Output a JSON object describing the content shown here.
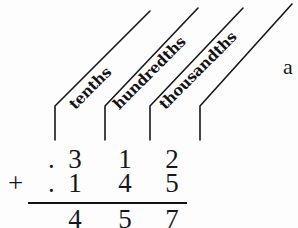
{
  "figure": {
    "kind": "decimal-addition-place-value-diagram",
    "background_color": "#fdfdfd",
    "ink_color": "#17171a",
    "place_labels": [
      {
        "text": "tenths",
        "x": 78,
        "y": 95,
        "angle": -45
      },
      {
        "text": "hundredths",
        "x": 122,
        "y": 95,
        "angle": -45
      },
      {
        "text": "thousandths",
        "x": 168,
        "y": 95,
        "angle": -45
      }
    ],
    "leader_lines": [
      {
        "vertical_x": 55,
        "vertical_top": 106,
        "vertical_bottom": 140,
        "diagonal_end_x": 150,
        "diagonal_end_y": 11
      },
      {
        "vertical_x": 105,
        "vertical_top": 106,
        "vertical_bottom": 140,
        "diagonal_end_x": 198,
        "diagonal_end_y": 8
      },
      {
        "vertical_x": 150,
        "vertical_top": 106,
        "vertical_bottom": 140,
        "diagonal_end_x": 243,
        "diagonal_end_y": 8
      },
      {
        "vertical_x": 200,
        "vertical_top": 106,
        "vertical_bottom": 140,
        "diagonal_end_x": 292,
        "diagonal_end_y": 4
      }
    ],
    "rows": [
      {
        "name": "addend-1",
        "operator": "",
        "decimal_point": ".",
        "digits": [
          "3",
          "1",
          "2"
        ],
        "value": ".312"
      },
      {
        "name": "addend-2",
        "operator": "+",
        "decimal_point": ".",
        "digits": [
          "1",
          "4",
          "5"
        ],
        "value": ".145"
      },
      {
        "name": "sum",
        "operator": "",
        "decimal_point": "",
        "digits": [
          "4",
          "5",
          "7"
        ],
        "value": ".457"
      }
    ],
    "rule": {
      "x": 28,
      "y": 202,
      "width": 159
    },
    "side_note": {
      "text": "a",
      "x": 283,
      "y": 56
    }
  }
}
